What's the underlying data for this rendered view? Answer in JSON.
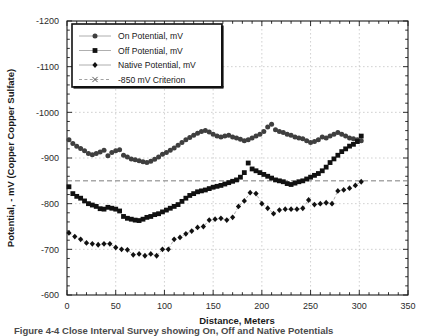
{
  "figure": {
    "xlabel": "Distance, Meters",
    "ylabel": "Potential, - mV (Copper Copper Sulfate)",
    "caption": "Figure 4-4   Close Interval Survey showing On, Off and Native Potentials"
  },
  "axes": {
    "x_ticks": [
      "0",
      "50",
      "100",
      "150",
      "200",
      "250",
      "300",
      "350"
    ],
    "y_ticks": [
      "-1200",
      "-1100",
      "-1000",
      "-900",
      "-800",
      "-700",
      "-600"
    ]
  },
  "legend": {
    "items": [
      {
        "label": "On Potential, mV",
        "marker": "circle-marker",
        "color": "#3f3f3f"
      },
      {
        "label": "Off Potential, mV",
        "marker": "square-marker",
        "color": "#111111"
      },
      {
        "label": "Native Potential, mV",
        "marker": "diamond-marker",
        "color": "#111111"
      },
      {
        "label": "-850 mV Criterion",
        "marker": "cross-marker",
        "color": "#777777"
      }
    ]
  },
  "chart_data": {
    "type": "scatter",
    "title": "",
    "xlabel": "Distance, Meters",
    "ylabel": "Potential, - mV (Copper Copper Sulfate)",
    "xlim": [
      0,
      350
    ],
    "ylim": [
      -600,
      -1200
    ],
    "y_axis_inverted": true,
    "xticks": [
      0,
      50,
      100,
      150,
      200,
      250,
      300,
      350
    ],
    "yticks": [
      -1200,
      -1100,
      -1000,
      -900,
      -800,
      -700,
      -600
    ],
    "grid": true,
    "legend_position": "upper-left",
    "criterion_line": {
      "label": "-850 mV Criterion",
      "value": -850,
      "style": "dashed"
    },
    "series": [
      {
        "name": "On Potential, mV",
        "marker": "circle",
        "color": "#3f3f3f",
        "x": [
          2,
          6,
          10,
          14,
          18,
          22,
          26,
          30,
          34,
          38,
          42,
          46,
          50,
          54,
          58,
          62,
          66,
          70,
          74,
          78,
          82,
          86,
          90,
          94,
          98,
          102,
          106,
          110,
          114,
          118,
          122,
          126,
          130,
          134,
          138,
          142,
          146,
          150,
          154,
          158,
          162,
          166,
          170,
          174,
          178,
          182,
          186,
          190,
          194,
          198,
          202,
          206,
          210,
          214,
          218,
          222,
          226,
          230,
          234,
          238,
          242,
          246,
          250,
          254,
          258,
          262,
          266,
          270,
          274,
          278,
          282,
          286,
          290,
          294,
          298,
          302
        ],
        "y": [
          -940,
          -932,
          -926,
          -921,
          -916,
          -910,
          -907,
          -910,
          -913,
          -917,
          -905,
          -912,
          -916,
          -918,
          -906,
          -902,
          -898,
          -896,
          -894,
          -892,
          -890,
          -893,
          -897,
          -902,
          -908,
          -912,
          -917,
          -922,
          -928,
          -934,
          -940,
          -945,
          -950,
          -954,
          -958,
          -960,
          -957,
          -952,
          -948,
          -946,
          -948,
          -950,
          -946,
          -944,
          -941,
          -938,
          -940,
          -944,
          -948,
          -952,
          -958,
          -968,
          -974,
          -962,
          -958,
          -956,
          -952,
          -950,
          -946,
          -944,
          -942,
          -938,
          -934,
          -936,
          -940,
          -946,
          -944,
          -948,
          -952,
          -956,
          -952,
          -948,
          -944,
          -942,
          -940,
          -938
        ]
      },
      {
        "name": "Off Potential, mV",
        "marker": "square",
        "color": "#111111",
        "x": [
          2,
          6,
          10,
          14,
          18,
          22,
          26,
          30,
          34,
          38,
          42,
          46,
          50,
          54,
          58,
          62,
          66,
          70,
          74,
          78,
          82,
          86,
          90,
          94,
          98,
          102,
          106,
          110,
          114,
          118,
          122,
          126,
          130,
          134,
          138,
          142,
          146,
          150,
          154,
          158,
          162,
          166,
          170,
          174,
          178,
          182,
          186,
          190,
          194,
          198,
          202,
          206,
          210,
          214,
          218,
          222,
          226,
          230,
          234,
          238,
          242,
          246,
          250,
          254,
          258,
          262,
          266,
          270,
          274,
          278,
          282,
          286,
          290,
          294,
          298,
          302
        ],
        "y": [
          -837,
          -822,
          -816,
          -812,
          -806,
          -800,
          -797,
          -794,
          -789,
          -788,
          -792,
          -790,
          -788,
          -784,
          -772,
          -768,
          -766,
          -764,
          -763,
          -766,
          -770,
          -772,
          -776,
          -778,
          -782,
          -786,
          -790,
          -794,
          -798,
          -805,
          -812,
          -818,
          -822,
          -826,
          -828,
          -830,
          -833,
          -836,
          -838,
          -840,
          -843,
          -846,
          -849,
          -852,
          -858,
          -868,
          -889,
          -876,
          -872,
          -868,
          -864,
          -860,
          -856,
          -852,
          -850,
          -848,
          -844,
          -842,
          -845,
          -848,
          -850,
          -854,
          -858,
          -862,
          -866,
          -872,
          -880,
          -890,
          -898,
          -906,
          -914,
          -920,
          -926,
          -930,
          -936,
          -948
        ]
      },
      {
        "name": "Native Potential, mV",
        "marker": "diamond",
        "color": "#111111",
        "x": [
          2,
          8,
          14,
          20,
          26,
          32,
          38,
          44,
          50,
          56,
          62,
          68,
          74,
          80,
          86,
          92,
          98,
          104,
          110,
          116,
          122,
          128,
          134,
          140,
          146,
          152,
          158,
          164,
          170,
          176,
          182,
          188,
          194,
          200,
          206,
          212,
          218,
          224,
          230,
          236,
          242,
          248,
          254,
          260,
          266,
          272,
          278,
          284,
          290,
          296,
          302
        ],
        "y": [
          -736,
          -728,
          -722,
          -714,
          -712,
          -710,
          -712,
          -712,
          -704,
          -700,
          -699,
          -688,
          -690,
          -686,
          -690,
          -686,
          -700,
          -700,
          -722,
          -726,
          -734,
          -740,
          -748,
          -750,
          -764,
          -766,
          -768,
          -764,
          -770,
          -794,
          -806,
          -824,
          -822,
          -800,
          -790,
          -778,
          -786,
          -788,
          -788,
          -788,
          -790,
          -808,
          -798,
          -800,
          -802,
          -800,
          -828,
          -830,
          -834,
          -840,
          -848
        ]
      }
    ]
  }
}
